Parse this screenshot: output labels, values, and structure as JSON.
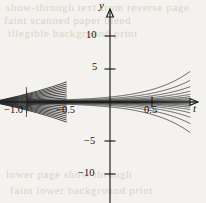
{
  "figure": {
    "name": "solution-family-plot",
    "background_color": "#f4f2ee",
    "ink_color": "#1a1a1a",
    "curve_color": "#2b2b2b"
  },
  "axes": {
    "x_axis_name": "t",
    "y_axis_name": "y",
    "x_ticks": [
      {
        "value": -1.0,
        "label": "−1.0"
      },
      {
        "value": -0.5,
        "label": "−0.5"
      },
      {
        "value": 0.5,
        "label": "0.5"
      }
    ],
    "y_ticks": [
      {
        "value": 10,
        "label": "10"
      },
      {
        "value": 5,
        "label": "5"
      },
      {
        "value": -5,
        "label": "−5"
      },
      {
        "value": -10,
        "label": "−10"
      }
    ]
  },
  "background_text": {
    "line1": "show-through text from reverse page",
    "line2": "faint scanned paper bleed",
    "line3": "illegible background print",
    "line4": "lower page show-through",
    "line5": "faint lower background print"
  },
  "chart_data": {
    "type": "line",
    "title": "",
    "subtitle": "",
    "xlabel": "t",
    "ylabel": "y",
    "xlim": [
      -1.12,
      0.92
    ],
    "ylim": [
      -13.5,
      13.5
    ],
    "grid": false,
    "legend": false,
    "singular_point_t": -1.0,
    "curve_count": 19,
    "curves_above_axis": 9,
    "curves_below_axis": 9,
    "curves_on_axis": 1,
    "series": [
      {
        "name": "C = +2.2",
        "C": 2.2,
        "direction": "up"
      },
      {
        "name": "C = +1.55",
        "C": 1.55,
        "direction": "up"
      },
      {
        "name": "C = +1.1",
        "C": 1.1,
        "direction": "up"
      },
      {
        "name": "C = +0.78",
        "C": 0.78,
        "direction": "up"
      },
      {
        "name": "C = +0.55",
        "C": 0.55,
        "direction": "up"
      },
      {
        "name": "C = +0.38",
        "C": 0.38,
        "direction": "up"
      },
      {
        "name": "C = +0.25",
        "C": 0.25,
        "direction": "up"
      },
      {
        "name": "C = +0.15",
        "C": 0.15,
        "direction": "up"
      },
      {
        "name": "C = +0.07",
        "C": 0.07,
        "direction": "up"
      },
      {
        "name": "C = 0",
        "C": 0.0,
        "direction": "flat"
      },
      {
        "name": "C = -0.07",
        "C": -0.07,
        "direction": "down"
      },
      {
        "name": "C = -0.15",
        "C": -0.15,
        "direction": "down"
      },
      {
        "name": "C = -0.25",
        "C": -0.25,
        "direction": "down"
      },
      {
        "name": "C = -0.38",
        "C": -0.38,
        "direction": "down"
      },
      {
        "name": "C = -0.55",
        "C": -0.55,
        "direction": "down"
      },
      {
        "name": "C = -0.78",
        "C": -0.78,
        "direction": "down"
      },
      {
        "name": "C = -1.1",
        "C": -1.1,
        "direction": "down"
      },
      {
        "name": "C = -1.55",
        "C": -1.55,
        "direction": "down"
      },
      {
        "name": "C = -2.2",
        "C": -2.2,
        "direction": "down"
      }
    ]
  }
}
